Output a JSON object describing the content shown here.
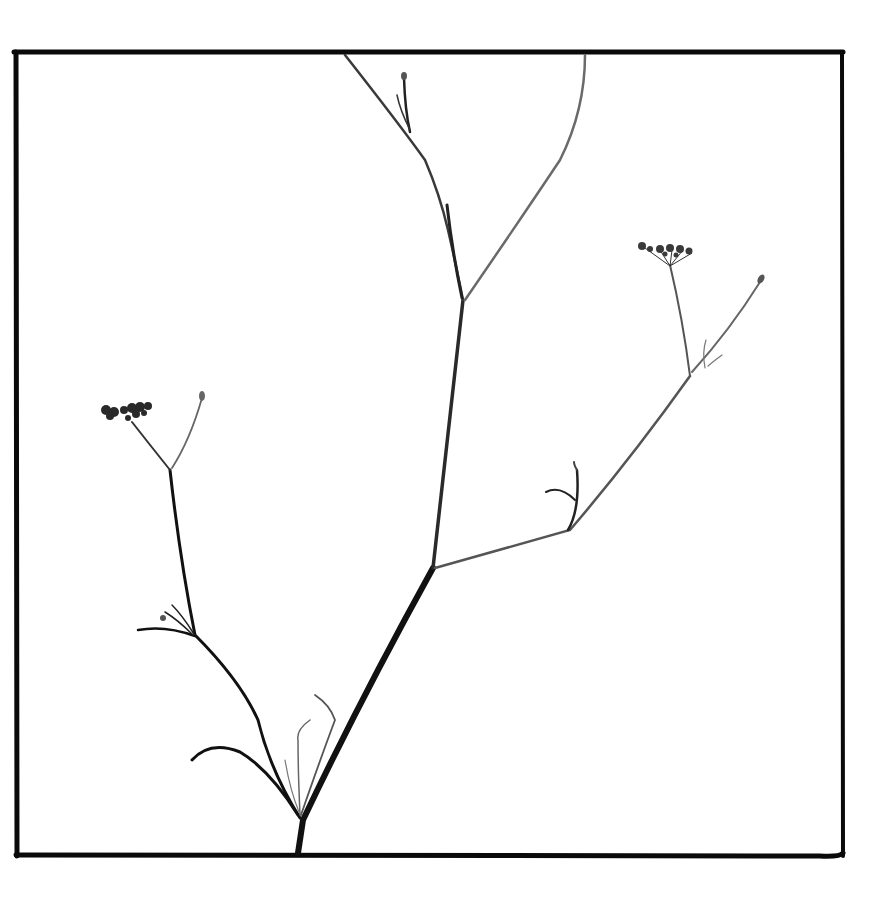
{
  "image": {
    "subject": "dried umbellifer plant stem with branching umbels",
    "style": "black and white photograph with black border frame",
    "colors": {
      "background": "#ffffff",
      "frame": "#0a0a0a",
      "stem_dark": "#111111",
      "stem_mid": "#3a3a3a",
      "stem_light": "#6a6a6a"
    }
  }
}
